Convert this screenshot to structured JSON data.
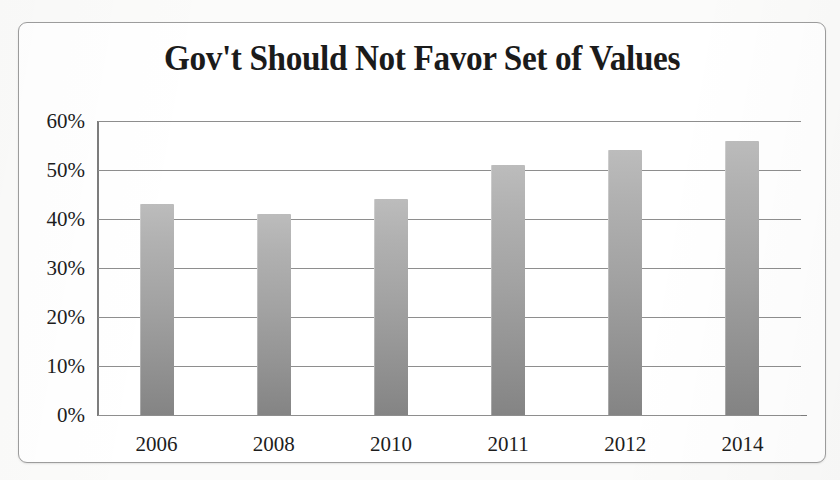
{
  "chart_data": {
    "type": "bar",
    "title": "Gov't Should Not Favor Set of Values",
    "xlabel": "",
    "ylabel": "",
    "categories": [
      "2006",
      "2008",
      "2010",
      "2011",
      "2012",
      "2014"
    ],
    "values": [
      43,
      41,
      44,
      51,
      54,
      56
    ],
    "value_labels": [
      "43%",
      "41%",
      "44%",
      "51%",
      "54%",
      "56%"
    ],
    "ylim": [
      0,
      60
    ],
    "ytick_values": [
      0,
      10,
      20,
      30,
      40,
      50,
      60
    ],
    "ytick_labels": [
      "0%",
      "10%",
      "20%",
      "30%",
      "40%",
      "50%",
      "60%"
    ],
    "grid": true,
    "legend": false,
    "legend_position": "none",
    "series": [
      {
        "name": "Gov't should not favor any particular set of values",
        "values": [
          43,
          41,
          44,
          51,
          54,
          56
        ]
      }
    ],
    "colors": {
      "bar_top": "#bcbcbc",
      "bar_bottom": "#848484",
      "gridline": "#8e8e8e",
      "axis": "#7d7d7d",
      "text": "#1d1d1d",
      "frame_border": "#9d9d9d",
      "plot_background": "#ffffff",
      "page_background": "#fbfbfa"
    }
  }
}
